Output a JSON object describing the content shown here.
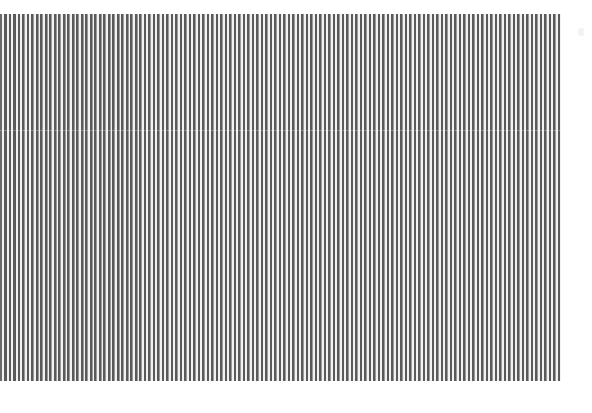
{
  "image": {
    "description": "Vertical black-and-white striped grating pattern",
    "stripe_period_px": 4.5,
    "stripe_count_approx": 124,
    "colors": {
      "dark_stripe": "#5a5a5a",
      "light_stripe": "#f2f2f2",
      "background": "#ffffff"
    }
  }
}
